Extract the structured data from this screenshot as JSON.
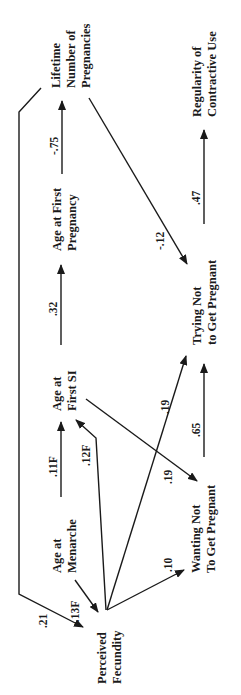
{
  "diagram": {
    "type": "path-model",
    "orientation": "rotated-90-ccw",
    "nodes": {
      "lifetime_pregnancies": {
        "line1": "Lifetime",
        "line2": "Number of",
        "line3": "Pregnancies"
      },
      "regularity": {
        "line1": "Regularity of",
        "line2": "Contractive Use"
      },
      "age_first_pregnancy": {
        "line1": "Age at First",
        "line2": "Pregnancy"
      },
      "trying_not": {
        "line1": "Trying Not",
        "line2": "to Get Pregnant"
      },
      "age_first_si": {
        "line1": "Age at",
        "line2": "First SI"
      },
      "wanting_not": {
        "line1": "Wanting Not",
        "line2": "To Get Pregnant"
      },
      "age_menarche": {
        "line1": "Age at",
        "line2": "Menarche"
      },
      "perceived_fecundity": {
        "line1": "Perceived",
        "line2": "Fecundity"
      }
    },
    "edges": [
      {
        "from": "perceived_fecundity",
        "to": "lifetime_pregnancies",
        "coef": ".21",
        "note": "bidirectional link via side line"
      },
      {
        "from": "age_menarche",
        "to": "perceived_fecundity",
        "coef": "-.13F"
      },
      {
        "from": "age_menarche",
        "to": "age_first_si",
        "coef": ".11F"
      },
      {
        "from": "perceived_fecundity",
        "to": "age_first_si",
        "coef": ".12F"
      },
      {
        "from": "perceived_fecundity",
        "to": "wanting_not",
        "coef": ".10"
      },
      {
        "from": "perceived_fecundity",
        "to": "trying_not",
        "coef": ".19"
      },
      {
        "from": "age_first_si",
        "to": "wanting_not",
        "coef": ".19"
      },
      {
        "from": "wanting_not",
        "to": "trying_not",
        "coef": ".65"
      },
      {
        "from": "age_first_si",
        "to": "age_first_pregnancy",
        "coef": ".32"
      },
      {
        "from": "age_first_pregnancy",
        "to": "lifetime_pregnancies",
        "coef": "-.75"
      },
      {
        "from": "lifetime_pregnancies",
        "to": "trying_not",
        "coef": "-.12"
      },
      {
        "from": "trying_not",
        "to": "regularity",
        "coef": ".47"
      }
    ]
  }
}
